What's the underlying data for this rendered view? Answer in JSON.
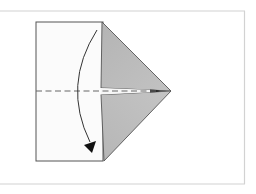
{
  "diagram": {
    "type": "origami-fold-step",
    "colors": {
      "background": "#ffffff",
      "frame": "#d4d4d4",
      "paper_white": "#fbfbfb",
      "paper_colored": "#b9b9b9",
      "outline": "#555555",
      "fold_line": "#666666",
      "arrow": "#222222"
    },
    "elements": {
      "frame": "frame-border",
      "paper": "square-paper-white-side",
      "kite_flaps": "colored-triangular-flaps",
      "valley_fold": "dashed-center-fold-line",
      "arrow": "curved-fold-arrow-down"
    }
  }
}
